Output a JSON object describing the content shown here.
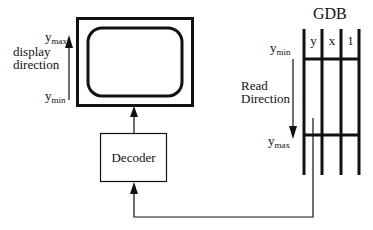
{
  "display": {
    "ymax_label": "y",
    "ymax_sub": "max",
    "ymin_label": "y",
    "ymin_sub": "min",
    "direction_line1": "display",
    "direction_line2": "direction"
  },
  "decoder": {
    "label": "Decoder"
  },
  "gdb": {
    "title": "GDB",
    "columns": [
      "y",
      "x",
      "1"
    ],
    "ymin_label": "y",
    "ymin_sub": "min",
    "ymax_label": "y",
    "ymax_sub": "max",
    "direction_line1": "Read",
    "direction_line2": "Direction"
  },
  "colors": {
    "stroke": "#111111",
    "background": "#ffffff"
  }
}
